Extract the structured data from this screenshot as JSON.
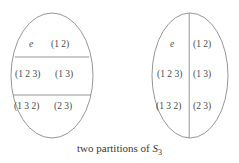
{
  "figure": {
    "caption_prefix": "two partitions of ",
    "caption_group_symbol": "S",
    "caption_group_subscript": "3",
    "caption_full": "two partitions of S3",
    "stroke_color": "#8a8a8a",
    "text_color": "#4a4a4a",
    "background_color": "#ffffff"
  },
  "left_diagram": {
    "name": "left-ellipse",
    "partition_type": "horizontal-rows",
    "row_count": 3,
    "rows": [
      {
        "cells": [
          "e",
          "(1 2)"
        ]
      },
      {
        "cells": [
          "(1 2 3)",
          "(1 3)"
        ]
      },
      {
        "cells": [
          "(1 3 2)",
          "(2 3)"
        ]
      }
    ],
    "labels": {
      "r0c0": "e",
      "r0c1": "(1 2)",
      "r1c0": "(1 2 3)",
      "r1c1": "(1 3)",
      "r2c0": "(1 3 2)",
      "r2c1": "(2 3)"
    }
  },
  "right_diagram": {
    "name": "right-ellipse",
    "partition_type": "vertical-columns",
    "column_count": 2,
    "columns": [
      {
        "cells": [
          "e",
          "(1 2 3)",
          "(1 3 2)"
        ]
      },
      {
        "cells": [
          "(1 2)",
          "(1 3)",
          "(2 3)"
        ]
      }
    ],
    "labels": {
      "r0c0": "e",
      "r0c1": "(1 2)",
      "r1c0": "(1 2 3)",
      "r1c1": "(1 3)",
      "r2c0": "(1 3 2)",
      "r2c1": "(2 3)"
    }
  }
}
